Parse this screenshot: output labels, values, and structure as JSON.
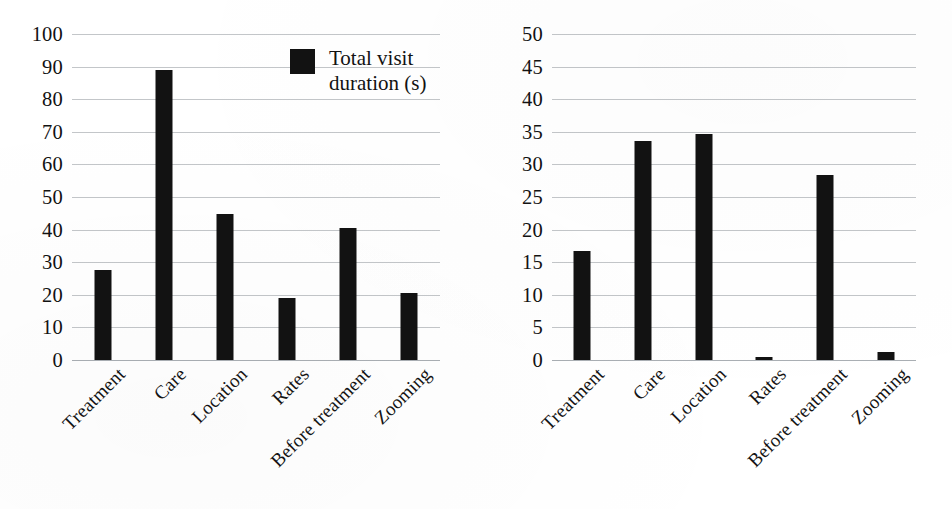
{
  "figure": {
    "background": "#ffffff",
    "bar_color": "#121212",
    "grid_color": "#b9bcc0"
  },
  "chart_data": [
    {
      "type": "bar",
      "title": "",
      "xlabel": "",
      "ylabel": "",
      "ylim": [
        0,
        100
      ],
      "yticks": [
        0,
        10,
        20,
        30,
        40,
        50,
        60,
        70,
        80,
        90,
        100
      ],
      "grid": true,
      "legend_position": "upper-right",
      "legend": [
        "Total visit duration (s)"
      ],
      "categories": [
        "Treatment",
        "Care",
        "Location",
        "Rates",
        "Before treatment",
        "Zooming"
      ],
      "series": [
        {
          "name": "Total visit duration (s)",
          "values": [
            27.5,
            89.0,
            44.8,
            19.0,
            40.5,
            20.5
          ]
        }
      ]
    },
    {
      "type": "bar",
      "title": "",
      "xlabel": "",
      "ylabel": "",
      "ylim": [
        0,
        50
      ],
      "yticks": [
        0,
        5,
        10,
        15,
        20,
        25,
        30,
        35,
        40,
        45,
        50
      ],
      "grid": true,
      "legend_position": "upper-right",
      "legend": [
        "Number of errors"
      ],
      "categories": [
        "Treatment",
        "Care",
        "Location",
        "Rates",
        "Before treatment",
        "Zooming"
      ],
      "series": [
        {
          "name": "Number of errors",
          "values": [
            16.7,
            33.6,
            34.6,
            0.5,
            28.3,
            1.2
          ]
        }
      ]
    }
  ],
  "left_chart": {
    "legend_label": "Total visit\nduration (s)",
    "yticks": [
      "100",
      "90",
      "80",
      "70",
      "60",
      "50",
      "40",
      "30",
      "20",
      "10",
      "0"
    ],
    "xlabels": [
      "Treatment",
      "Care",
      "Location",
      "Rates",
      "Before treatment",
      "Zooming"
    ]
  },
  "right_chart": {
    "legend_label": "Number\nof errors",
    "yticks": [
      "50",
      "45",
      "40",
      "35",
      "30",
      "25",
      "20",
      "15",
      "10",
      "5",
      "0"
    ],
    "xlabels": [
      "Treatment",
      "Care",
      "Location",
      "Rates",
      "Before treatment",
      "Zooming"
    ]
  }
}
